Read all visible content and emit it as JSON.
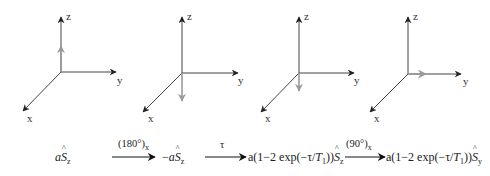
{
  "colors": {
    "axis": "#333333",
    "magnetization_vector": "#9a9a9a",
    "background": "#ffffff"
  },
  "frames": [
    {
      "name": "initial",
      "axis_labels": {
        "z": "z",
        "y": "y",
        "x": "x"
      },
      "vector": "along +z (partial length)"
    },
    {
      "name": "after-180x",
      "axis_labels": {
        "z": "z",
        "y": "y",
        "x": "x"
      },
      "vector": "along -z"
    },
    {
      "name": "after-tau",
      "axis_labels": {
        "z": "z",
        "y": "y",
        "x": "x"
      },
      "vector": "along -z (shorter, relaxed)"
    },
    {
      "name": "after-90x",
      "axis_labels": {
        "z": "z",
        "y": "y",
        "x": "x"
      },
      "vector": "along +y"
    }
  ],
  "equation": {
    "state1": {
      "coef": "a",
      "op": "S",
      "sub": "z"
    },
    "arrow1_label": {
      "text": "(180°)",
      "sub": "x"
    },
    "state2": {
      "sign": "−",
      "coef": "a",
      "op": "S",
      "sub": "z"
    },
    "arrow2_label": {
      "text": "τ"
    },
    "state3": {
      "prefix": "a(1−2 exp(−τ/",
      "T": "T",
      "Tsub": "1",
      "suffix": "))",
      "op": "S",
      "sub": "z"
    },
    "arrow3_label": {
      "text": "(90°)",
      "sub": "x"
    },
    "state4": {
      "prefix": "a(1−2 exp(−τ/",
      "T": "T",
      "Tsub": "1",
      "suffix": "))",
      "op": "S",
      "sub": "y"
    }
  }
}
